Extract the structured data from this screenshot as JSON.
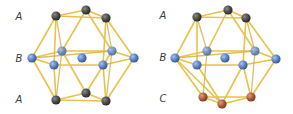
{
  "figures": [
    {
      "name": "hcp-cuboctahedron",
      "layer_labels": [
        {
          "text": "A",
          "x": 19,
          "y": 20
        },
        {
          "text": "B",
          "x": 19,
          "y": 62
        },
        {
          "text": "A",
          "x": 19,
          "y": 103
        }
      ],
      "atoms": {
        "top": [
          [
            56,
            16
          ],
          [
            86,
            10
          ],
          [
            106,
            18
          ]
        ],
        "middle_back": [
          [
            62,
            51
          ],
          [
            112,
            51
          ]
        ],
        "middle_center": [
          [
            82,
            58
          ]
        ],
        "middle_sides": [
          [
            32,
            58
          ],
          [
            134,
            58
          ]
        ],
        "middle_front": [
          [
            54,
            65
          ],
          [
            103,
            65
          ]
        ],
        "bottom": [
          [
            56,
            100
          ],
          [
            86,
            93
          ],
          [
            106,
            101
          ]
        ]
      },
      "bottom_layer_color": "#4a4a4a"
    },
    {
      "name": "fcc-cuboctahedron",
      "layer_labels": [
        {
          "text": "A",
          "x": 163,
          "y": 19
        },
        {
          "text": "B",
          "x": 163,
          "y": 61
        },
        {
          "text": "C",
          "x": 163,
          "y": 102
        }
      ],
      "atoms": {
        "top": [
          [
            197,
            17
          ],
          [
            228,
            10
          ],
          [
            246,
            18
          ]
        ],
        "middle_back": [
          [
            207,
            51
          ],
          [
            255,
            51
          ]
        ],
        "middle_center": [
          [
            225,
            58
          ]
        ],
        "middle_sides": [
          [
            175,
            58
          ],
          [
            276,
            59
          ]
        ],
        "middle_front": [
          [
            197,
            65
          ],
          [
            243,
            65
          ]
        ],
        "bottom": [
          [
            203,
            97
          ],
          [
            222,
            104
          ],
          [
            251,
            97
          ]
        ]
      },
      "bottom_layer_color": "#b0603e"
    }
  ],
  "colors": {
    "layer_a": "#4a4a4a",
    "layer_b": "#5f86c8",
    "layer_c": "#b0603e",
    "bond": "#e8c24a"
  }
}
